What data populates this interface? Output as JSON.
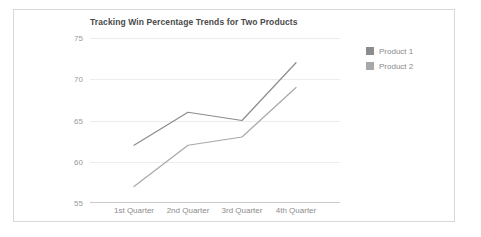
{
  "card": {
    "background": "#ffffff",
    "border_color": "#d8d8d8"
  },
  "chart_data": {
    "type": "line",
    "title": "Tracking Win Percentage Trends for Two Products",
    "xlabel": "",
    "ylabel": "",
    "categories": [
      "1st Quarter",
      "2nd Quarter",
      "3rd Quarter",
      "4th Quarter"
    ],
    "yticks": [
      55,
      60,
      65,
      70,
      75
    ],
    "ylim": [
      55,
      75
    ],
    "grid": true,
    "legend_position": "right-top",
    "series": [
      {
        "name": "Product 1",
        "color": "#8c8c8c",
        "values": [
          62,
          66,
          65,
          72
        ]
      },
      {
        "name": "Product 2",
        "color": "#a8a8a8",
        "values": [
          57,
          62,
          63,
          69
        ]
      }
    ]
  }
}
